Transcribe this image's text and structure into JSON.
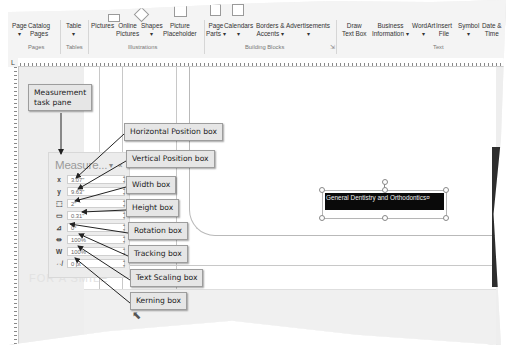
{
  "ribbon": {
    "groups": [
      {
        "label": "Pages",
        "buttons": [
          {
            "label": "Page",
            "sub": "▾"
          },
          {
            "label": "Catalog",
            "sub": "Pages"
          }
        ]
      },
      {
        "label": "Tables",
        "buttons": [
          {
            "label": "Table",
            "sub": "▾"
          }
        ]
      },
      {
        "label": "Illustrations",
        "buttons": [
          {
            "label": "Pictures",
            "sub": ""
          },
          {
            "label": "Online",
            "sub": "Pictures"
          },
          {
            "label": "Shapes",
            "sub": "▾"
          },
          {
            "label": "Picture",
            "sub": "Placeholder"
          }
        ]
      },
      {
        "label": "Building Blocks",
        "buttons": [
          {
            "label": "Page",
            "sub": "Parts ▾"
          },
          {
            "label": "Calendars",
            "sub": "▾"
          },
          {
            "label": "Borders &",
            "sub": "Accents ▾"
          },
          {
            "label": "Advertisements",
            "sub": "▾"
          }
        ]
      },
      {
        "label": "Text",
        "buttons": [
          {
            "label": "Draw",
            "sub": "Text Box"
          },
          {
            "label": "Business",
            "sub": "Information ▾"
          },
          {
            "label": "WordArt",
            "sub": "▾"
          },
          {
            "label": "Insert",
            "sub": "File"
          },
          {
            "label": "Symbol",
            "sub": "▾"
          },
          {
            "label": "Date &",
            "sub": "Time"
          }
        ]
      }
    ],
    "launcher_icon": "dialog-launcher-icon"
  },
  "ruler": {
    "corner": "L"
  },
  "measurement_pane": {
    "title": "Measure...",
    "dropdown_glyph": "▾",
    "close_glyph": "×",
    "rows": [
      {
        "icon": "x",
        "name": "horizontal-position",
        "value": "3.07\""
      },
      {
        "icon": "y",
        "name": "vertical-position",
        "value": "9.63\""
      },
      {
        "icon": "⬚",
        "name": "width",
        "value": "2\""
      },
      {
        "icon": "▭",
        "name": "height",
        "value": "0.31\""
      },
      {
        "icon": "⊿",
        "name": "rotation",
        "value": "0°"
      },
      {
        "icon": "⇹",
        "name": "tracking",
        "value": "100%"
      },
      {
        "icon": "W",
        "name": "text-scaling",
        "value": "100%"
      },
      {
        "icon": "⇎",
        "name": "kerning",
        "value": "0 pt"
      }
    ]
  },
  "callouts": {
    "task_pane": "Measurement\ntask pane",
    "horizontal": "Horizontal Position box",
    "vertical": "Vertical Position box",
    "width": "Width box",
    "height": "Height box",
    "rotation": "Rotation box",
    "tracking": "Tracking box",
    "text_scaling": "Text Scaling box",
    "kerning": "Kerning box"
  },
  "document": {
    "selected_text_box": "General Dentistry and Orthodontics¤",
    "faded_text": "FOR A SMILE"
  },
  "colors": {
    "callout_bg": "#e6e6e6",
    "text_box_fill": "#0a0a0a",
    "ribbon_bg": "#f4f4f4"
  }
}
